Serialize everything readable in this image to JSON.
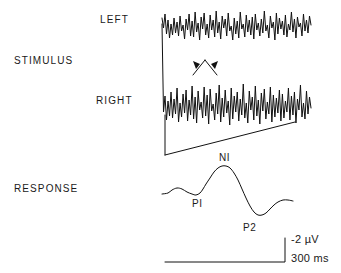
{
  "figure": {
    "background_color": "#ffffff",
    "trace_color": "#111111"
  },
  "row_labels": {
    "left": "LEFT",
    "stimulus": "STIMULUS",
    "right": "RIGHT",
    "response": "RESPONSE"
  },
  "peak_labels": {
    "p1": "PI",
    "n1": "NI",
    "p2": "P2"
  },
  "scale_bar": {
    "amplitude": "-2 µV",
    "time": "300 ms"
  },
  "chart_data": {
    "type": "line",
    "title": "",
    "xlabel": "",
    "ylabel": "",
    "grid": false,
    "legend_position": "none",
    "axis_ranges": {
      "x_units": "ms",
      "x_scale_bar_ms": 300,
      "y_units": "µV",
      "y_scale_bar_uv": -2
    },
    "annotations": [
      {
        "text": "PI",
        "x": 196,
        "y": 198
      },
      {
        "text": "NI",
        "x": 224,
        "y": 152
      },
      {
        "text": "P2",
        "x": 250,
        "y": 222
      },
      {
        "text": "-2 µV",
        "x": 291,
        "y": 238
      },
      {
        "text": "300 ms",
        "x": 291,
        "y": 258
      }
    ],
    "series": [
      {
        "name": "LEFT",
        "type": "eeg-raw",
        "baseline_y": 26,
        "x_start": 162,
        "x_end": 311,
        "values": [
          18,
          28,
          14,
          34,
          20,
          38,
          24,
          35,
          18,
          33,
          22,
          36,
          16,
          31,
          25,
          39,
          19,
          30,
          14,
          36,
          21,
          37,
          12,
          32,
          23,
          40,
          17,
          29,
          13,
          35,
          24,
          38,
          15,
          30,
          20,
          37,
          11,
          33,
          22,
          39,
          16,
          28,
          19,
          36,
          13,
          31,
          26,
          40,
          18,
          34,
          21,
          38,
          12,
          29,
          24,
          37,
          15,
          32,
          20,
          35,
          17,
          39,
          14,
          30,
          23,
          36,
          19,
          33,
          11,
          31,
          25,
          38,
          16,
          28,
          22,
          40,
          13,
          34,
          18,
          29,
          21,
          35,
          15,
          37,
          24,
          30,
          12,
          32,
          19,
          38,
          17,
          27,
          23,
          36,
          14,
          31,
          20,
          33,
          16,
          25
        ]
      },
      {
        "name": "RIGHT",
        "type": "eeg-raw",
        "baseline_y": 103,
        "x_start": 162,
        "x_end": 311,
        "values": [
          24,
          112,
          96,
          120,
          101,
          116,
          92,
          118,
          99,
          114,
          88,
          122,
          103,
          117,
          94,
          113,
          90,
          121,
          100,
          115,
          86,
          119,
          97,
          123,
          91,
          110,
          102,
          118,
          87,
          116,
          95,
          124,
          89,
          111,
          104,
          120,
          93,
          114,
          85,
          122,
          98,
          117,
          90,
          113,
          101,
          125,
          88,
          119,
          96,
          112,
          92,
          121,
          99,
          115,
          84,
          118,
          103,
          123,
          91,
          110,
          97,
          120,
          86,
          116,
          100,
          124,
          93,
          111,
          89,
          119,
          102,
          114,
          87,
          122,
          95,
          117,
          98,
          113,
          90,
          121,
          94,
          118,
          101,
          112,
          88,
          120,
          96,
          115,
          92,
          123,
          99,
          110,
          85,
          117,
          103,
          119,
          91,
          114,
          97,
          108
        ]
      },
      {
        "name": "STIMULUS_RAMP",
        "type": "ramp",
        "points": [
          [
            165,
            155
          ],
          [
            295,
            122
          ]
        ]
      },
      {
        "name": "STIMULUS_ONSET",
        "type": "vertical-marker",
        "points": [
          [
            165,
            115
          ],
          [
            165,
            155
          ]
        ]
      },
      {
        "name": "RESPONSE",
        "type": "evoked-potential",
        "points": [
          [
            162,
            194
          ],
          [
            168,
            193
          ],
          [
            172,
            190
          ],
          [
            177,
            188
          ],
          [
            182,
            189
          ],
          [
            187,
            192
          ],
          [
            192,
            194
          ],
          [
            196,
            195
          ],
          [
            200,
            193
          ],
          [
            203,
            189
          ],
          [
            206,
            184
          ],
          [
            210,
            178
          ],
          [
            214,
            172
          ],
          [
            218,
            168
          ],
          [
            222,
            166
          ],
          [
            226,
            166
          ],
          [
            230,
            168
          ],
          [
            234,
            173
          ],
          [
            238,
            180
          ],
          [
            242,
            189
          ],
          [
            246,
            198
          ],
          [
            250,
            206
          ],
          [
            254,
            212
          ],
          [
            258,
            215
          ],
          [
            262,
            215
          ],
          [
            266,
            213
          ],
          [
            270,
            209
          ],
          [
            274,
            205
          ],
          [
            278,
            202
          ],
          [
            283,
            200
          ],
          [
            288,
            200
          ],
          [
            293,
            201
          ]
        ]
      }
    ]
  }
}
